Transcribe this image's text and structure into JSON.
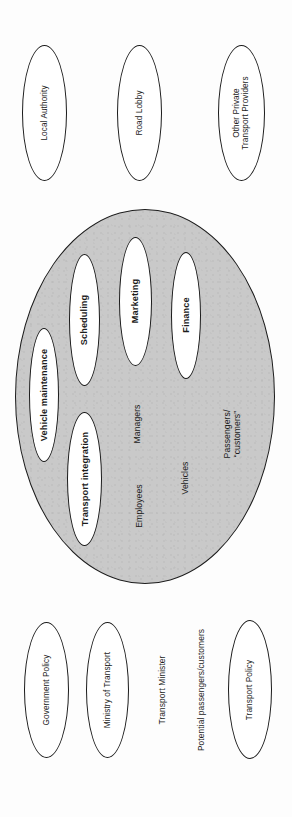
{
  "figure": {
    "orientation": "rotated-90",
    "colors": {
      "core_fill": "#c9c9c9",
      "node_fill": "#ffffff",
      "stroke": "#1b1b1b",
      "text": "#1c1c1c",
      "page": "#ffffff"
    }
  },
  "top_stakeholders": [
    {
      "label": "Local Authority"
    },
    {
      "label": "Road Lobby"
    },
    {
      "label": "Other Private\nTransport Providers"
    }
  ],
  "core": {
    "name": "transport-organisation-core",
    "functions": [
      {
        "label": "Vehicle maintenance"
      },
      {
        "label": "Scheduling"
      },
      {
        "label": "Transport integration"
      },
      {
        "label": "Marketing"
      },
      {
        "label": "Finance"
      }
    ],
    "resources": [
      {
        "label": "Employees"
      },
      {
        "label": "Managers"
      },
      {
        "label": "Vehicles"
      },
      {
        "label": "Passengers/\n“customers”"
      }
    ]
  },
  "bottom_stakeholders": [
    {
      "label": "Government Policy",
      "shape": "ellipse"
    },
    {
      "label": "Ministry of Transport",
      "shape": "ellipse"
    },
    {
      "label": "Transport Minister",
      "shape": "text"
    },
    {
      "label": "Potential passengers/customers",
      "shape": "text"
    },
    {
      "label": "Transport Policy",
      "shape": "ellipse"
    }
  ]
}
